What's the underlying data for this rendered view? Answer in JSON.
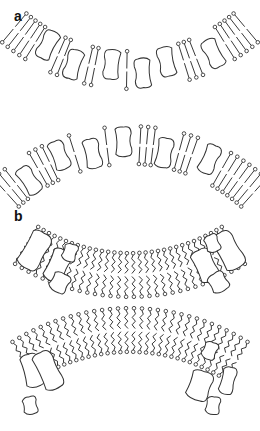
{
  "figure": {
    "panels": [
      {
        "label": "a",
        "description": "Membrane bilayers with straight (ordered) lipid tails and embedded proteins",
        "bilayers": [
          {
            "curvature": "concave-up",
            "tail_style": "straight",
            "protein_count": 6
          },
          {
            "curvature": "convex-up",
            "tail_style": "straight",
            "protein_count": 6
          }
        ]
      },
      {
        "label": "b",
        "description": "Membrane bilayers with wavy (disordered) lipid tails; proteins excluded to the edges",
        "bilayers": [
          {
            "curvature": "concave-up",
            "tail_style": "wavy",
            "protein_count": 8
          },
          {
            "curvature": "convex-up",
            "tail_style": "wavy",
            "protein_count": 8
          }
        ]
      }
    ],
    "colors": {
      "line": "#222222",
      "background": "#ffffff"
    }
  }
}
